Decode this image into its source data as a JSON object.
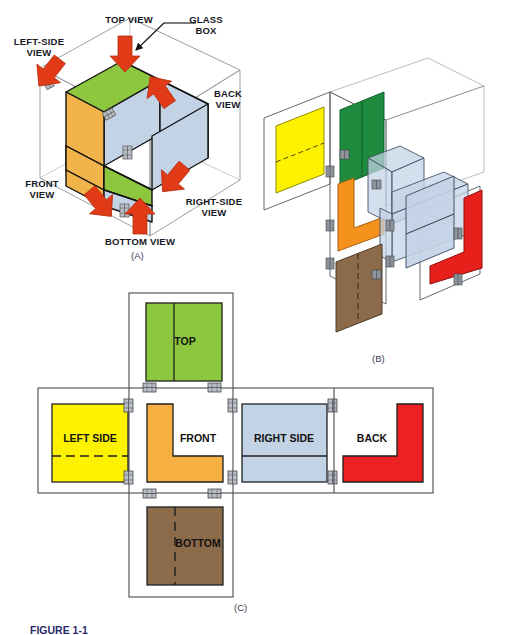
{
  "figure": {
    "caption_label": "FIGURE 1-1",
    "caption_text": "The glass box principle",
    "panels": [
      {
        "id": "A",
        "letter": "(A)"
      },
      {
        "id": "B",
        "letter": "(B)"
      },
      {
        "id": "C",
        "letter": "(C)"
      }
    ]
  },
  "panel_a": {
    "letter": "(A)",
    "callout": "GLASS\nBOX",
    "arrow_labels": [
      {
        "name": "top-view",
        "text": "TOP VIEW"
      },
      {
        "name": "left-side-view",
        "text": "LEFT-SIDE\nVIEW"
      },
      {
        "name": "back-view",
        "text": "BACK\nVIEW"
      },
      {
        "name": "front-view",
        "text": "FRONT\nVIEW"
      },
      {
        "name": "right-side-view",
        "text": "RIGHT-SIDE\nVIEW"
      },
      {
        "name": "bottom-view",
        "text": "BOTTOM VIEW"
      }
    ]
  },
  "panel_b": {
    "letter": "(B)",
    "planes": [
      {
        "name": "top-plane",
        "color": "#1f8b3e"
      },
      {
        "name": "left-side-plane",
        "color": "#fff200"
      },
      {
        "name": "front-plane",
        "color": "#f5921e"
      },
      {
        "name": "right-side-plane",
        "color": "#c3d3e6"
      },
      {
        "name": "back-plane",
        "color": "#e8201c"
      },
      {
        "name": "bottom-plane",
        "color": "#8b6b4a"
      }
    ]
  },
  "panel_c": {
    "letter": "(C)",
    "views": [
      {
        "name": "top",
        "label": "TOP",
        "color": "#8dc63f",
        "line": "solid-vertical"
      },
      {
        "name": "left-side",
        "label": "LEFT SIDE",
        "color": "#fff200",
        "line": "dashed-horizontal"
      },
      {
        "name": "front",
        "label": "FRONT",
        "color": "#f5b041",
        "line": "none"
      },
      {
        "name": "right-side",
        "label": "RIGHT SIDE",
        "color": "#c3d3e6",
        "line": "solid-horizontal"
      },
      {
        "name": "back",
        "label": "BACK",
        "color": "#ed2024",
        "line": "none"
      },
      {
        "name": "bottom",
        "label": "BOTTOM",
        "color": "#8b6b4a",
        "line": "dashed-vertical"
      }
    ],
    "hinge_count": 12
  },
  "colors": {
    "green_light": "#8dc63f",
    "green_dark": "#1f8b3e",
    "yellow": "#fff200",
    "orange": "#f5b041",
    "orange_dark": "#f5921e",
    "blue_gray": "#c3d3e6",
    "red": "#ed2024",
    "brown": "#8b6b4a",
    "arrow_red": "#e03a17",
    "glass_line": "#9aa0a8",
    "hinge": "#8e949c",
    "outline": "#1a1a1a"
  }
}
